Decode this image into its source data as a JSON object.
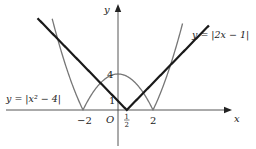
{
  "chart_data": {
    "type": "line",
    "title": "",
    "xlabel": "x",
    "ylabel": "y",
    "origin_label": "O",
    "xlim": [
      -6.74,
      7.89
    ],
    "ylim": [
      -4.33,
      12.22
    ],
    "grid": false,
    "x_ticks": [
      {
        "value": -2,
        "label": "−2"
      },
      {
        "value": 0.5,
        "label": "1/2",
        "num": "1",
        "den": "2"
      },
      {
        "value": 2,
        "label": "2"
      }
    ],
    "y_ticks": [
      {
        "value": 1,
        "label": "1"
      },
      {
        "value": 4,
        "label": "4"
      }
    ],
    "series": [
      {
        "name": "y = |2x − 1|",
        "label": "y = |2x − 1|",
        "expr": "abs(2*x-1)",
        "x_range": [
          -4.6,
          5.2
        ],
        "color": "#1a1a1a",
        "width": 2.2
      },
      {
        "name": "y = |x² − 4|",
        "label": "y = |x² − 4|",
        "expr": "abs(x*x-4)",
        "x_range": [
          -3.76,
          3.69
        ],
        "color": "#777777",
        "width": 1.3
      }
    ],
    "key_points": [
      {
        "x": -2,
        "y": 0
      },
      {
        "x": 0.5,
        "y": 0
      },
      {
        "x": 2,
        "y": 0
      },
      {
        "x": 0,
        "y": 4
      },
      {
        "x": 0,
        "y": 1
      },
      {
        "x": 3,
        "y": 5
      },
      {
        "x": -3.449,
        "y": 7.899
      }
    ]
  },
  "labels": {
    "x_axis": "x",
    "y_axis": "y",
    "origin": "O",
    "tick_neg2": "−2",
    "tick_2": "2",
    "tick_half_num": "1",
    "tick_half_den": "2",
    "tick_y1": "1",
    "tick_y4": "4",
    "eq_line": "y = |2x − 1|",
    "eq_curve": "y = |x² − 4|"
  }
}
